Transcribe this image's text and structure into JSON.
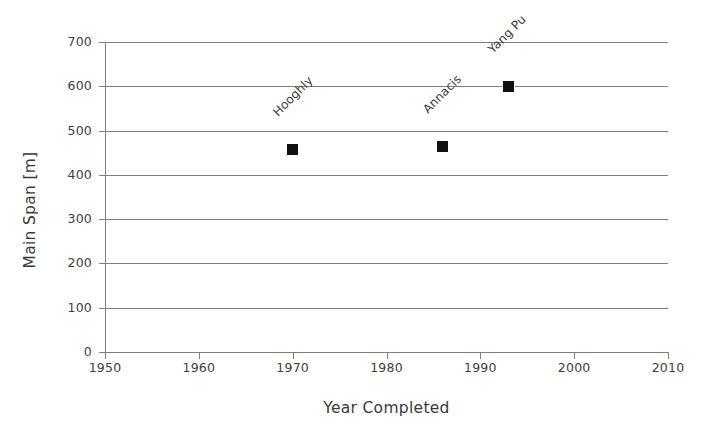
{
  "chart_data": {
    "type": "scatter",
    "title": "",
    "xlabel": "Year Completed",
    "ylabel": "Main Span [m]",
    "xlim": [
      1950,
      2010
    ],
    "ylim": [
      0,
      700
    ],
    "xticks": [
      1950,
      1960,
      1970,
      1980,
      1990,
      2000,
      2010
    ],
    "yticks": [
      0,
      100,
      200,
      300,
      400,
      500,
      600,
      700
    ],
    "grid": "horizontal",
    "legend": "none",
    "marker_color": "#111111",
    "gridline_color": "#7f7f7f",
    "points": [
      {
        "label": "Hooghly",
        "x": 1970,
        "y": 458
      },
      {
        "label": "Annacis",
        "x": 1986,
        "y": 465
      },
      {
        "label": "Yang Pu",
        "x": 1993,
        "y": 600
      }
    ]
  }
}
